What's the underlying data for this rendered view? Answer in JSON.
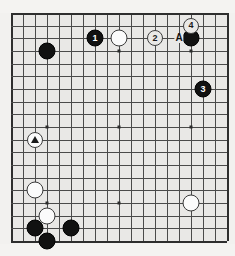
{
  "board": {
    "size": 19,
    "grid_color": "#4a4a4a",
    "edge_color": "#2e2e2e",
    "background_color": "#e9e8e6",
    "page_background": "#f2f1ef",
    "star_points": [
      {
        "col": 4,
        "row": 4
      },
      {
        "col": 10,
        "row": 4
      },
      {
        "col": 16,
        "row": 4
      },
      {
        "col": 4,
        "row": 10
      },
      {
        "col": 10,
        "row": 10
      },
      {
        "col": 16,
        "row": 10
      },
      {
        "col": 4,
        "row": 16
      },
      {
        "col": 10,
        "row": 16
      },
      {
        "col": 16,
        "row": 16
      }
    ]
  },
  "stones": [
    {
      "col": 4,
      "row": 4,
      "color": "black",
      "label": ""
    },
    {
      "col": 8,
      "row": 3,
      "color": "black",
      "label": "1"
    },
    {
      "col": 10,
      "row": 3,
      "color": "white",
      "label": ""
    },
    {
      "col": 16,
      "row": 3,
      "color": "black",
      "label": ""
    },
    {
      "col": 17,
      "row": 7,
      "color": "black",
      "label": "3"
    },
    {
      "col": 3,
      "row": 15,
      "color": "white",
      "label": ""
    },
    {
      "col": 4,
      "row": 17,
      "color": "white",
      "label": ""
    },
    {
      "col": 3,
      "row": 18,
      "color": "black",
      "label": ""
    },
    {
      "col": 4,
      "row": 19,
      "color": "black",
      "label": ""
    },
    {
      "col": 6,
      "row": 18,
      "color": "black",
      "label": ""
    },
    {
      "col": 16,
      "row": 16,
      "color": "white",
      "label": ""
    }
  ],
  "markers": [
    {
      "col": 13,
      "row": 3,
      "text": "2",
      "kind": "circled-number"
    },
    {
      "col": 16,
      "row": 2,
      "text": "4",
      "kind": "circled-number"
    },
    {
      "col": 3,
      "row": 11,
      "text": "△",
      "kind": "circled-triangle"
    }
  ],
  "point_labels": [
    {
      "col": 15,
      "row": 3,
      "text": "A"
    }
  ],
  "legend": {
    "move_1": "1",
    "move_2": "2",
    "move_3": "3",
    "move_4": "4",
    "point_a": "A",
    "triangle": "△"
  }
}
